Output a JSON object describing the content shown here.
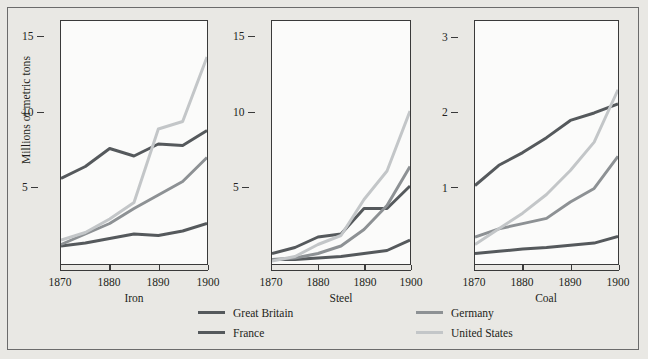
{
  "figure": {
    "ylabel": "Millions of metric tons",
    "background_color": "#e9e8e4",
    "plot_background_color": "#fbfbfa",
    "frame_color": "#6b6b6b"
  },
  "legend": {
    "position": "bottom",
    "entries": [
      {
        "label": "Great Britain",
        "color": "#55595c"
      },
      {
        "label": "France",
        "color": "#55595c"
      },
      {
        "label": "Germany",
        "color": "#8d9194"
      },
      {
        "label": "United States",
        "color": "#c3c6c8"
      }
    ]
  },
  "chart_data": [
    {
      "type": "line",
      "title": "Iron",
      "xlabel": "Iron",
      "ylabel": "Millions of metric tons",
      "x": [
        1870,
        1875,
        1880,
        1885,
        1890,
        1895,
        1900
      ],
      "xticks": [
        1870,
        1880,
        1890,
        1900
      ],
      "yticks": [
        5,
        10,
        15
      ],
      "xlim": [
        1870,
        1900
      ],
      "ylim": [
        0,
        16.2
      ],
      "grid": false,
      "series": [
        {
          "name": "Great Britain",
          "color": "#55595c",
          "values": [
            5.7,
            6.5,
            7.7,
            7.2,
            8.0,
            7.9,
            8.9
          ]
        },
        {
          "name": "France",
          "color": "#55595c",
          "values": [
            1.2,
            1.4,
            1.7,
            2.0,
            1.9,
            2.2,
            2.7
          ]
        },
        {
          "name": "Germany",
          "color": "#8d9194",
          "values": [
            1.3,
            2.0,
            2.7,
            3.7,
            4.6,
            5.5,
            7.1
          ]
        },
        {
          "name": "United States",
          "color": "#c3c6c8",
          "values": [
            1.6,
            2.1,
            3.0,
            4.1,
            9.0,
            9.5,
            13.8
          ]
        }
      ]
    },
    {
      "type": "line",
      "title": "Steel",
      "xlabel": "Steel",
      "ylabel": "Millions of metric tons",
      "x": [
        1870,
        1875,
        1880,
        1885,
        1890,
        1895,
        1900
      ],
      "xticks": [
        1870,
        1880,
        1890,
        1900
      ],
      "yticks": [
        5,
        10,
        15
      ],
      "xlim": [
        1870,
        1900
      ],
      "ylim": [
        0,
        16.2
      ],
      "grid": false,
      "series": [
        {
          "name": "Great Britain",
          "color": "#55595c",
          "values": [
            0.7,
            1.1,
            1.8,
            2.0,
            3.7,
            3.7,
            5.2
          ]
        },
        {
          "name": "France",
          "color": "#55595c",
          "values": [
            0.3,
            0.3,
            0.4,
            0.5,
            0.7,
            0.9,
            1.6
          ]
        },
        {
          "name": "Germany",
          "color": "#8d9194",
          "values": [
            0.3,
            0.4,
            0.7,
            1.2,
            2.3,
            3.9,
            6.5
          ]
        },
        {
          "name": "United States",
          "color": "#c3c6c8",
          "values": [
            0.2,
            0.5,
            1.3,
            1.9,
            4.3,
            6.2,
            10.2
          ]
        }
      ]
    },
    {
      "type": "line",
      "title": "Coal",
      "xlabel": "Coal",
      "ylabel": "Millions of metric tons",
      "x": [
        1870,
        1875,
        1880,
        1885,
        1890,
        1895,
        1900
      ],
      "xticks": [
        1870,
        1880,
        1890,
        1900
      ],
      "yticks": [
        1,
        2,
        3
      ],
      "xlim": [
        1870,
        1900
      ],
      "ylim": [
        0,
        3.25
      ],
      "grid": false,
      "series": [
        {
          "name": "Great Britain",
          "color": "#55595c",
          "values": [
            1.05,
            1.32,
            1.49,
            1.69,
            1.92,
            2.02,
            2.14
          ]
        },
        {
          "name": "France",
          "color": "#55595c",
          "values": [
            0.14,
            0.17,
            0.2,
            0.22,
            0.25,
            0.28,
            0.37
          ]
        },
        {
          "name": "Germany",
          "color": "#8d9194",
          "values": [
            0.36,
            0.47,
            0.54,
            0.61,
            0.83,
            1.01,
            1.44
          ]
        },
        {
          "name": "United States",
          "color": "#c3c6c8",
          "values": [
            0.26,
            0.47,
            0.68,
            0.93,
            1.25,
            1.63,
            2.33
          ]
        }
      ]
    }
  ]
}
